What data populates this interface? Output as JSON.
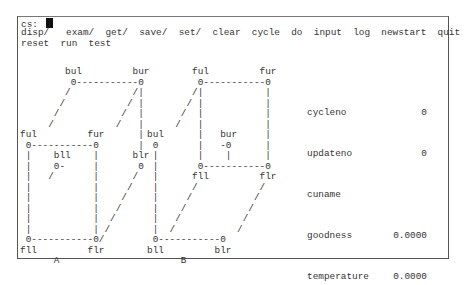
{
  "prompt": {
    "label": "cs:"
  },
  "menu": {
    "row1": [
      "disp/",
      "exam/",
      "get/",
      "save/",
      "set/",
      "clear",
      "cycle",
      "do",
      "input",
      "log",
      "newstart",
      "quit"
    ],
    "row2": [
      "reset",
      "run",
      "test"
    ]
  },
  "cube_a": {
    "caption": "A",
    "art": "        bul         bur\n         0-----------0\n        /           /|\n       /           / |\n      /           /  |\n     /           /   |\nful         fur      |\n 0-----------0       |\n |    bll    |      blr\n |    0-     |       0\n |   /       |      /\n |           |     /\n |           |    /\n |           |   /\n |           |  /\n |           | /\n 0-----------0/\nfll         flr\n      A",
    "nodes": [
      "bul",
      "bur",
      "ful",
      "fur",
      "bll",
      "blr",
      "fll",
      "flr"
    ]
  },
  "cube_b": {
    "caption": "B",
    "art": "        ful         fur\n         0-----------0\n        /|           |\n       / |           |\n      /  |           |\n     /   |           |\nbul      |   bur     |\n 0       |   -0      |\n |       |    |      |\n |       0-----------0\n |      fll         flr\n |      /           /\n |     /           /\n |    /           /\n |   /           /\n |  /           /\n 0-----------0\nbll         blr\n      B",
    "nodes": [
      "ful",
      "fur",
      "bul",
      "bur",
      "fll",
      "flr",
      "bll",
      "blr"
    ]
  },
  "stats": [
    {
      "label": "cycleno",
      "value": "0"
    },
    {
      "label": "updateno",
      "value": "0"
    },
    {
      "label": "cuname",
      "value": ""
    },
    {
      "label": "goodness",
      "value": "0.0000"
    },
    {
      "label": "temperature",
      "value": "0.0000"
    }
  ]
}
